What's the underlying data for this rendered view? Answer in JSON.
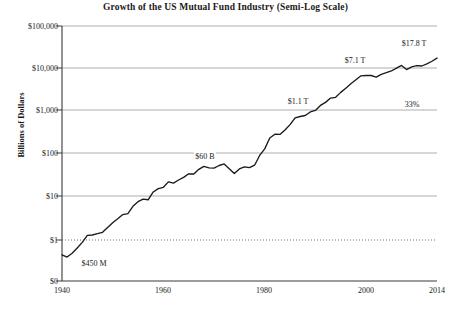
{
  "chart_data": {
    "type": "line",
    "title": "Growth of the US Mutual Fund Industry  (Semi-Log Scale)",
    "xlabel": "",
    "ylabel": "Billions of Dollars",
    "scale": "semi-log",
    "grid": true,
    "legend": "none",
    "xlim": [
      1940,
      2014
    ],
    "ylim": [
      0.1,
      100000
    ],
    "ytick_labels": [
      "$100,000",
      "$10,000",
      "$1,000",
      "$100",
      "$10",
      "$1",
      "$0"
    ],
    "ytick_values": [
      100000,
      10000,
      1000,
      100,
      10,
      1,
      0
    ],
    "xtick_labels": [
      "1940",
      "1960",
      "1980",
      "2000",
      "2014"
    ],
    "xtick_values": [
      1940,
      1960,
      1980,
      2000,
      2014
    ],
    "x": [
      1940,
      1941,
      1942,
      1943,
      1944,
      1945,
      1946,
      1947,
      1948,
      1949,
      1950,
      1951,
      1952,
      1953,
      1954,
      1955,
      1956,
      1957,
      1958,
      1959,
      1960,
      1961,
      1962,
      1963,
      1964,
      1965,
      1966,
      1967,
      1968,
      1969,
      1970,
      1971,
      1972,
      1973,
      1974,
      1975,
      1976,
      1977,
      1978,
      1979,
      1980,
      1981,
      1982,
      1983,
      1984,
      1985,
      1986,
      1987,
      1988,
      1989,
      1990,
      1991,
      1992,
      1993,
      1994,
      1995,
      1996,
      1997,
      1998,
      1999,
      2000,
      2001,
      2002,
      2003,
      2004,
      2005,
      2006,
      2007,
      2008,
      2009,
      2010,
      2011,
      2012,
      2013,
      2014
    ],
    "values": [
      0.45,
      0.4,
      0.49,
      0.65,
      0.88,
      1.28,
      1.31,
      1.41,
      1.51,
      1.97,
      2.53,
      3.13,
      3.93,
      4.15,
      6.11,
      7.84,
      9.05,
      8.71,
      13.24,
      15.82,
      17.03,
      22.79,
      21.27,
      25.21,
      29.12,
      35.22,
      34.83,
      44.7,
      52.68,
      48.29,
      47.62,
      55.05,
      59.83,
      46.52,
      35.78,
      45.87,
      51.28,
      48.94,
      55.84,
      94.51,
      134.76,
      241.37,
      296.68,
      292.99,
      370.68,
      495.49,
      716.25,
      769.17,
      809.37,
      980.67,
      1065.19,
      1393.19,
      1642.54,
      2069.96,
      2155.32,
      2811.29,
      3525.8,
      4468.2,
      5525.21,
      6846.34,
      6964.63,
      6974.91,
      6383.48,
      7402.42,
      8095.08,
      8891.11,
      10397.94,
      11999.54,
      9602.57,
      11120.58,
      11820.73,
      11626.46,
      13044.79,
      15017.6,
      17800.0
    ],
    "annotations": [
      {
        "label": "$450 M",
        "x": 1940,
        "y": 0.45,
        "note": "start of series"
      },
      {
        "label": "$60 B",
        "x": 1972,
        "y": 59.83
      },
      {
        "label": "$1.1 T",
        "x": 1990,
        "y": 1065.19
      },
      {
        "label": "$7.1 T",
        "x": 2000,
        "y": 6964.63
      },
      {
        "label": "$17.8 T",
        "x": 2014,
        "y": 17800.0
      },
      {
        "label": "33%",
        "x": 2008,
        "y": 1700,
        "note": "right-side callout above $1,000 gridline"
      }
    ]
  }
}
